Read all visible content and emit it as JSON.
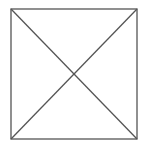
{
  "diagram": {
    "canvas": {
      "width": 145,
      "height": 153,
      "background": "#ffffff"
    },
    "stroke_color": "#555555",
    "stroke_width": 1.3,
    "square": {
      "x": 11,
      "y": 9,
      "width": 126,
      "height": 130
    },
    "diagonals": [
      {
        "name": "top-left-to-bottom-right",
        "x1": 11,
        "y1": 9,
        "x2": 137,
        "y2": 139
      },
      {
        "name": "top-right-to-bottom-left",
        "x1": 137,
        "y1": 9,
        "x2": 11,
        "y2": 139
      }
    ]
  }
}
